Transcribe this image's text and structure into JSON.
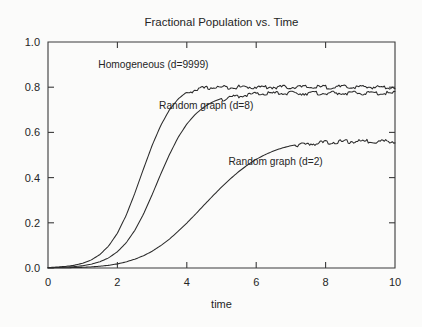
{
  "chart_data": {
    "type": "line",
    "title": "Fractional Population vs. Time",
    "xlabel": "time",
    "ylabel": "",
    "xlim": [
      0,
      10
    ],
    "ylim": [
      0,
      1.0
    ],
    "xticks": [
      "0",
      "2",
      "4",
      "6",
      "8",
      "10"
    ],
    "xtick_values": [
      0,
      2,
      4,
      6,
      8,
      10
    ],
    "yticks": [
      "0.0",
      "0.2",
      "0.4",
      "0.6",
      "0.8",
      "1.0"
    ],
    "ytick_values": [
      0.0,
      0.2,
      0.4,
      0.6,
      0.8,
      1.0
    ],
    "grid": false,
    "legend_position": "inline-annotations",
    "x": [
      0.0,
      0.25,
      0.5,
      0.75,
      1.0,
      1.25,
      1.5,
      1.75,
      2.0,
      2.25,
      2.5,
      2.75,
      3.0,
      3.25,
      3.5,
      3.75,
      4.0,
      4.25,
      4.5,
      4.75,
      5.0,
      5.25,
      5.5,
      5.75,
      6.0,
      6.25,
      6.5,
      6.75,
      7.0,
      7.25,
      7.5,
      7.75,
      8.0,
      8.25,
      8.5,
      8.75,
      9.0,
      9.25,
      9.5,
      9.75,
      10.0
    ],
    "series": [
      {
        "name": "Homogeneous (d=9999)",
        "plateau": 0.805,
        "midpoint": 2.1,
        "values": [
          0.002,
          0.004,
          0.007,
          0.012,
          0.021,
          0.036,
          0.06,
          0.098,
          0.154,
          0.232,
          0.33,
          0.438,
          0.542,
          0.631,
          0.7,
          0.748,
          0.779,
          0.793,
          0.8,
          0.803,
          0.804,
          0.805,
          0.805,
          0.805,
          0.805,
          0.805,
          0.805,
          0.805,
          0.805,
          0.805,
          0.805,
          0.805,
          0.805,
          0.805,
          0.805,
          0.805,
          0.805,
          0.805,
          0.805,
          0.805,
          0.805
        ]
      },
      {
        "name": "Random graph (d=8)",
        "plateau": 0.778,
        "midpoint": 3.1,
        "values": [
          0.001,
          0.002,
          0.004,
          0.006,
          0.01,
          0.017,
          0.028,
          0.045,
          0.072,
          0.111,
          0.166,
          0.238,
          0.324,
          0.416,
          0.502,
          0.578,
          0.637,
          0.681,
          0.713,
          0.735,
          0.75,
          0.76,
          0.766,
          0.771,
          0.774,
          0.776,
          0.777,
          0.778,
          0.778,
          0.778,
          0.778,
          0.778,
          0.778,
          0.778,
          0.778,
          0.778,
          0.778,
          0.778,
          0.778,
          0.778,
          0.778
        ]
      },
      {
        "name": "Random graph (d=2)",
        "plateau": 0.565,
        "midpoint": 5.8,
        "values": [
          0.0,
          0.001,
          0.001,
          0.002,
          0.003,
          0.005,
          0.008,
          0.012,
          0.018,
          0.027,
          0.039,
          0.054,
          0.074,
          0.099,
          0.128,
          0.162,
          0.199,
          0.238,
          0.279,
          0.319,
          0.358,
          0.394,
          0.427,
          0.456,
          0.481,
          0.501,
          0.518,
          0.531,
          0.541,
          0.548,
          0.553,
          0.557,
          0.56,
          0.562,
          0.563,
          0.564,
          0.565,
          0.565,
          0.565,
          0.565,
          0.565
        ]
      }
    ],
    "annotations": [
      {
        "text": "Homogeneous (d=9999)",
        "x": 1.45,
        "y": 0.885
      },
      {
        "text": "Random graph (d=8)",
        "x": 3.2,
        "y": 0.705
      },
      {
        "text": "Random graph (d=2)",
        "x": 5.2,
        "y": 0.455
      }
    ]
  }
}
